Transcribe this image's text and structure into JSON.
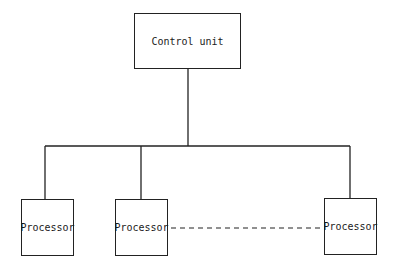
{
  "diagram": {
    "type": "hierarchical block diagram",
    "control_unit": {
      "label": "Control unit"
    },
    "processors": [
      {
        "label": "Processor"
      },
      {
        "label": "Processor"
      },
      {
        "label": "Processor"
      }
    ],
    "connections": {
      "bus": "solid tree from control unit to each processor",
      "ellipsis": "dashed line between second and last processor indicating additional processors"
    },
    "colors": {
      "line": "#222222",
      "background": "#ffffff"
    }
  }
}
